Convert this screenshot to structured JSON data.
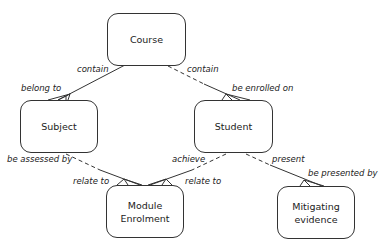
{
  "diagram": {
    "type": "entity-relationship",
    "entities": [
      {
        "id": "course",
        "label": "Course"
      },
      {
        "id": "subject",
        "label": "Subject"
      },
      {
        "id": "student",
        "label": "Student"
      },
      {
        "id": "module_enrolment",
        "label": "Module Enrolment"
      },
      {
        "id": "mitigating_evidence",
        "label": "Mitigating evidence"
      }
    ],
    "relationships": [
      {
        "from": "course",
        "to": "subject",
        "from_label": "contain",
        "to_label": "belong to"
      },
      {
        "from": "course",
        "to": "student",
        "from_label": "contain",
        "to_label": "be enrolled on"
      },
      {
        "from": "subject",
        "to": "module_enrolment",
        "from_label": "be assessed by",
        "to_label": "relate to"
      },
      {
        "from": "student",
        "to": "module_enrolment",
        "from_label": "achieve",
        "to_label": "relate to"
      },
      {
        "from": "student",
        "to": "mitigating_evidence",
        "from_label": "present",
        "to_label": "be presented by"
      }
    ],
    "labels": {
      "course_subject_contain": "contain",
      "course_subject_belong": "belong to",
      "course_student_contain": "contain",
      "course_student_enrolled": "be enrolled on",
      "subject_me_assessed": "be assessed by",
      "subject_me_relate": "relate to",
      "student_me_achieve": "achieve",
      "student_me_relate": "relate to",
      "student_mit_present": "present",
      "student_mit_presented": "be presented by"
    }
  }
}
